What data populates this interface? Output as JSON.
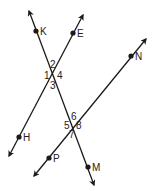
{
  "diagram": {
    "stroke_color": "#1a1a1a",
    "points": {
      "K": {
        "label": "K"
      },
      "E": {
        "label": "E"
      },
      "N": {
        "label": "N"
      },
      "H": {
        "label": "H"
      },
      "P": {
        "label": "P"
      },
      "M": {
        "label": "M"
      }
    },
    "lines": [
      {
        "name": "transversal",
        "through": [
          "K",
          "M"
        ]
      },
      {
        "name": "line-EH",
        "through": [
          "E",
          "H"
        ]
      },
      {
        "name": "line-NP",
        "through": [
          "N",
          "P"
        ]
      }
    ],
    "angles": {
      "a1": "1",
      "a2": "2",
      "a3": "3",
      "a4": "4",
      "a5": "5",
      "a6": "6",
      "a7": "7",
      "a8": "8"
    }
  }
}
